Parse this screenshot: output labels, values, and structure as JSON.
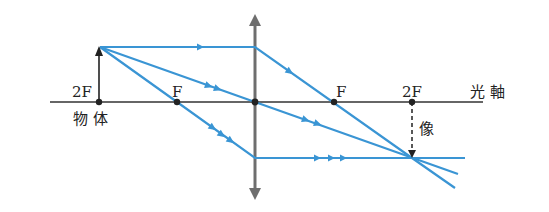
{
  "diagram": {
    "type": "convex-lens-ray-diagram",
    "colors": {
      "ray": "#3a95d4",
      "axis": "#333333",
      "lens": "#6e6e6e",
      "point": "#222222"
    },
    "labels": {
      "left_2f": "2F",
      "left_f": "F",
      "right_f": "F",
      "right_2f": "2F",
      "object": "物 体",
      "image": "像",
      "optical_axis": "光 軸"
    },
    "points": {
      "left_2f_x": 99,
      "left_f_x": 177,
      "lens_x": 255,
      "right_f_x": 334,
      "right_2f_x": 412,
      "axis_y": 102,
      "object_top_y": 47,
      "image_bottom_y": 158
    }
  }
}
